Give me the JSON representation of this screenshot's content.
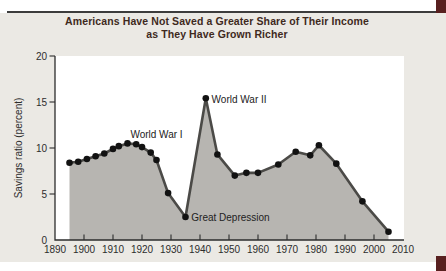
{
  "title": {
    "line1": "Americans Have Not Saved a Greater Share of Their Income",
    "line2": "as They Have Grown Richer"
  },
  "colors": {
    "panel": "#ebe9e4",
    "plot_bg": "#ffffff",
    "area_fill": "#b7b5b1",
    "line": "#4b4a47",
    "dot": "#121212",
    "axis": "#2d2d2d",
    "title_text": "#40291d",
    "label_text": "#2d2d2d",
    "annotation_text": "#222222",
    "rule": "#3c3c3c",
    "corner_block": "#58201f"
  },
  "chart_data": {
    "type": "area",
    "title": "Americans Have Not Saved a Greater Share of Their Income as They Have Grown Richer",
    "xlabel": "",
    "ylabel": "Savings ratio (percent)",
    "xlim": [
      1890,
      2010
    ],
    "ylim": [
      0,
      20
    ],
    "x_tick_labels": [
      1890,
      1900,
      1910,
      1920,
      1930,
      1940,
      1950,
      1960,
      1970,
      1980,
      1990,
      2000,
      2010
    ],
    "x_tick_marks": [
      1900,
      1910,
      1920,
      1930,
      1940,
      1950,
      1960,
      1970,
      1980,
      1990,
      2000
    ],
    "y_ticks": [
      0,
      5,
      10,
      15,
      20
    ],
    "grid": false,
    "legend": false,
    "points": [
      [
        1895,
        8.4
      ],
      [
        1898,
        8.5
      ],
      [
        1901,
        8.8
      ],
      [
        1904,
        9.1
      ],
      [
        1907,
        9.4
      ],
      [
        1910,
        9.9
      ],
      [
        1912,
        10.2
      ],
      [
        1915,
        10.5
      ],
      [
        1918,
        10.4
      ],
      [
        1920,
        10.1
      ],
      [
        1923,
        9.5
      ],
      [
        1925,
        8.7
      ],
      [
        1929,
        5.1
      ],
      [
        1935,
        2.5
      ],
      [
        1942,
        15.4
      ],
      [
        1946,
        9.3
      ],
      [
        1952,
        7.0
      ],
      [
        1956,
        7.3
      ],
      [
        1960,
        7.3
      ],
      [
        1967,
        8.2
      ],
      [
        1973,
        9.6
      ],
      [
        1978,
        9.2
      ],
      [
        1981,
        10.3
      ],
      [
        1987,
        8.3
      ],
      [
        1996,
        4.2
      ],
      [
        2005,
        0.9
      ]
    ],
    "annotations": [
      {
        "text": "World War I",
        "year": 1925,
        "value": 11.5,
        "anchor": "middle"
      },
      {
        "text": "World War II",
        "year": 1944,
        "value": 15.3,
        "anchor": "start"
      },
      {
        "text": "Great Depression",
        "year": 1937,
        "value": 2.4,
        "anchor": "start"
      }
    ]
  }
}
